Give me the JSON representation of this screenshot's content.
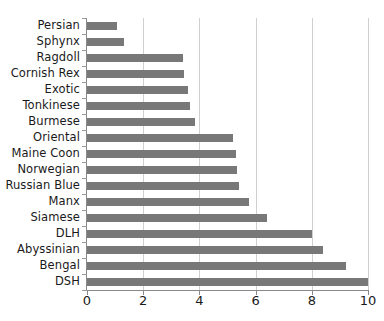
{
  "chart_data": {
    "type": "bar",
    "orientation": "horizontal",
    "title": "",
    "subtitle": "",
    "xlabel": "",
    "ylabel": "",
    "xlim": [
      0,
      10
    ],
    "xticks": [
      0,
      2,
      4,
      6,
      8,
      10
    ],
    "xtick_labels": [
      "0",
      "2",
      "4",
      "6",
      "8",
      "10"
    ],
    "grid": true,
    "grid_axis": "x",
    "legend": false,
    "legend_position": "none",
    "bar_color": "#787878",
    "gridline_color": "#cfcfcf",
    "axis_color": "#8a8a8a",
    "text_color": "#1a1a1a",
    "background_color": "#ffffff",
    "categories": [
      "Persian",
      "Sphynx",
      "Ragdoll",
      "Cornish Rex",
      "Exotic",
      "Tonkinese",
      "Burmese",
      "Oriental",
      "Maine Coon",
      "Norwegian",
      "Russian Blue",
      "Manx",
      "Siamese",
      "DLH",
      "Abyssinian",
      "Bengal",
      "DSH"
    ],
    "values": [
      1.05,
      1.3,
      3.4,
      3.45,
      3.6,
      3.65,
      3.85,
      5.2,
      5.3,
      5.35,
      5.4,
      5.75,
      6.4,
      8.0,
      8.4,
      9.2,
      10.0
    ]
  }
}
